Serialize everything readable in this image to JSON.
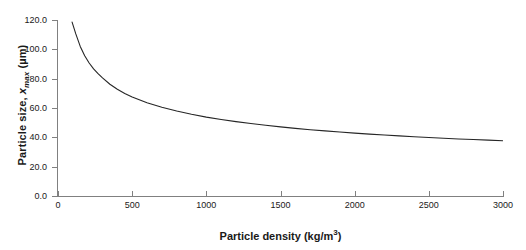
{
  "chart_data": {
    "type": "line",
    "title": "",
    "xlabel": "Particle density (kg/m3)",
    "xlabel_base": "Particle density (kg/m",
    "xlabel_sup": "3",
    "xlabel_tail": ")",
    "ylabel": "Particle size, xmax (µm)",
    "ylabel_pre": "Particle size, ",
    "ylabel_var": "x",
    "ylabel_sub": "max",
    "ylabel_post": " (µm)",
    "xlim": [
      0,
      3000
    ],
    "ylim": [
      0.0,
      120.0
    ],
    "grid": false,
    "legend": false,
    "legend_position": "none",
    "xticks": [
      0,
      500,
      1000,
      1500,
      2000,
      2500,
      3000
    ],
    "xtick_labels": [
      "0",
      "500",
      "1000",
      "1500",
      "2000",
      "2500",
      "3000"
    ],
    "yticks": [
      0.0,
      20.0,
      40.0,
      60.0,
      80.0,
      100.0,
      120.0
    ],
    "ytick_labels": [
      "0.0",
      "20.0",
      "40.0",
      "60.0",
      "80.0",
      "100.0",
      "120.0"
    ],
    "series": [
      {
        "name": "x_max vs density",
        "color": "#262626",
        "x": [
          95,
          120,
          150,
          180,
          210,
          240,
          270,
          300,
          350,
          400,
          450,
          500,
          600,
          700,
          800,
          900,
          1000,
          1100,
          1200,
          1300,
          1400,
          1500,
          1600,
          1700,
          1800,
          1900,
          2000,
          2100,
          2200,
          2300,
          2400,
          2500,
          2600,
          2700,
          2800,
          2900,
          3000
        ],
        "y": [
          118.6,
          110.5,
          102.0,
          95.6,
          90.7,
          86.7,
          83.4,
          80.5,
          76.2,
          72.8,
          69.9,
          67.5,
          63.6,
          60.5,
          57.9,
          55.7,
          53.8,
          52.2,
          50.7,
          49.4,
          48.2,
          47.1,
          46.1,
          45.2,
          44.4,
          43.6,
          42.9,
          42.2,
          41.6,
          41.0,
          40.4,
          39.9,
          39.4,
          38.9,
          38.5,
          38.1,
          37.7
        ]
      }
    ]
  }
}
